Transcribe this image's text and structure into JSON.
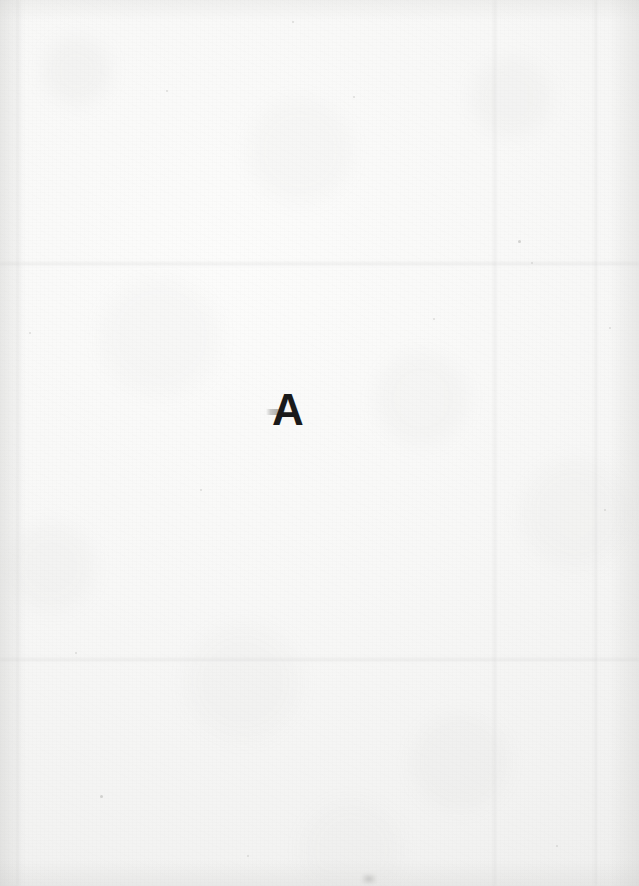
{
  "document": {
    "kind": "scanned-page",
    "page_width": 639,
    "page_height": 886,
    "background_color": "#f8f8f7",
    "ink_color": "#1a1a1a",
    "content_summary": "Blank scanned paper page with a single bold sans-serif capital letter near the centre"
  },
  "content": {
    "letter": "A",
    "letter_font_size_px": 44,
    "letter_left_px": 272,
    "letter_top_px": 388
  },
  "artifacts": {
    "creases": [
      {
        "orientation": "horizontal",
        "position_px": 264
      },
      {
        "orientation": "horizontal",
        "position_px": 660
      },
      {
        "orientation": "vertical",
        "position_px": 18
      },
      {
        "orientation": "vertical",
        "position_px": 495
      },
      {
        "orientation": "vertical",
        "position_px": 596
      }
    ],
    "specks": [
      {
        "x": 166,
        "y": 90,
        "d": 2
      },
      {
        "x": 353,
        "y": 96,
        "d": 2
      },
      {
        "x": 518,
        "y": 240,
        "d": 3
      },
      {
        "x": 531,
        "y": 262,
        "d": 2
      },
      {
        "x": 433,
        "y": 318,
        "d": 2
      },
      {
        "x": 29,
        "y": 332,
        "d": 2
      },
      {
        "x": 609,
        "y": 327,
        "d": 2
      },
      {
        "x": 200,
        "y": 489,
        "d": 2
      },
      {
        "x": 604,
        "y": 509,
        "d": 2
      },
      {
        "x": 100,
        "y": 795,
        "d": 3
      },
      {
        "x": 247,
        "y": 855,
        "d": 2
      },
      {
        "x": 556,
        "y": 845,
        "d": 2
      },
      {
        "x": 75,
        "y": 652,
        "d": 2
      },
      {
        "x": 292,
        "y": 21,
        "d": 2
      }
    ],
    "ghost_smudge": {
      "x": 266,
      "y": 409,
      "w": 20,
      "h": 6
    },
    "bottom_smudge": {
      "x": 362,
      "y": 874,
      "w": 14,
      "h": 10
    }
  }
}
